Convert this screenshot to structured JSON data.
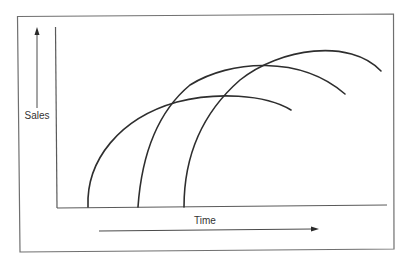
{
  "diagram": {
    "y_label": "Sales",
    "x_label": "Time",
    "y_arrow_direction": "up",
    "x_arrow_direction": "right",
    "colors": {
      "line": "#2e2e2e",
      "frame": "#6f6f6f",
      "background": "#ffffff"
    },
    "curves": [
      {
        "name": "product-1",
        "launch_order": 1,
        "relative_peak": "lowest",
        "shape": "rise-then-decline"
      },
      {
        "name": "product-2",
        "launch_order": 2,
        "relative_peak": "middle",
        "shape": "rise-then-decline"
      },
      {
        "name": "product-3",
        "launch_order": 3,
        "relative_peak": "highest",
        "shape": "rise-then-decline"
      }
    ]
  }
}
